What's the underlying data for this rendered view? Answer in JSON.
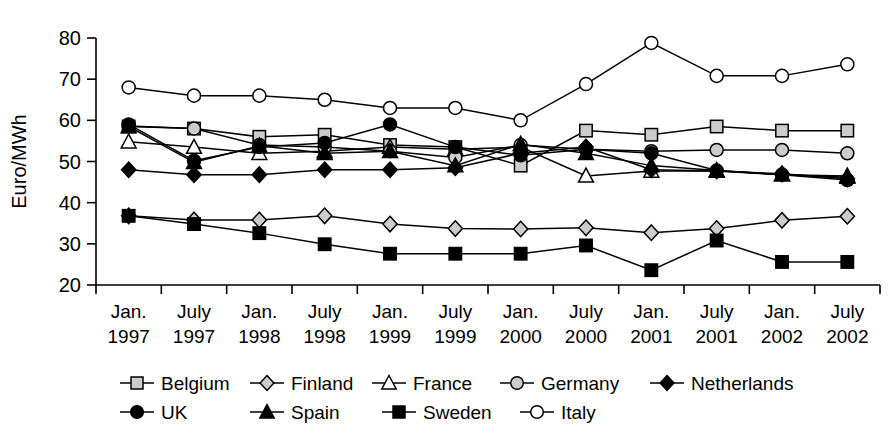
{
  "chart_data": {
    "type": "line",
    "title": "",
    "xlabel": "",
    "ylabel": "Euro/MWh",
    "ylim": [
      20,
      80
    ],
    "ytick_labels": [
      "80",
      "70",
      "60",
      "50",
      "40",
      "30",
      "20"
    ],
    "yticks": [
      80,
      70,
      60,
      50,
      40,
      30,
      20
    ],
    "grid": false,
    "legend_position": "bottom",
    "categories": [
      "Jan. 1997",
      "July 1997",
      "Jan. 1998",
      "July 1998",
      "Jan. 1999",
      "July 1999",
      "Jan. 2000",
      "July 2000",
      "Jan. 2001",
      "July 2001",
      "Jan. 2002",
      "July 2002"
    ],
    "category_lines": [
      [
        "Jan.",
        "1997"
      ],
      [
        "July",
        "1997"
      ],
      [
        "Jan.",
        "1998"
      ],
      [
        "July",
        "1998"
      ],
      [
        "Jan.",
        "1999"
      ],
      [
        "July",
        "1999"
      ],
      [
        "Jan.",
        "2000"
      ],
      [
        "July",
        "2000"
      ],
      [
        "Jan.",
        "2001"
      ],
      [
        "July",
        "2001"
      ],
      [
        "Jan.",
        "2002"
      ],
      [
        "July",
        "2002"
      ]
    ],
    "series": [
      {
        "name": "Belgium",
        "marker": "open-square",
        "values": [
          58.5,
          58.0,
          56.0,
          56.5,
          54.0,
          53.5,
          49.0,
          57.5,
          56.5,
          58.5,
          57.5,
          57.5
        ]
      },
      {
        "name": "Finland",
        "marker": "open-diamond",
        "values": [
          36.8,
          35.8,
          35.8,
          36.8,
          34.8,
          33.7,
          33.6,
          33.9,
          32.7,
          33.7,
          35.7,
          36.7
        ]
      },
      {
        "name": "France",
        "marker": "open-triangle",
        "values": [
          54.8,
          53.5,
          52.0,
          52.5,
          53.5,
          53.0,
          53.5,
          46.5,
          47.7,
          47.7,
          46.8,
          46.5
        ]
      },
      {
        "name": "Germany",
        "marker": "gray-circle",
        "values": [
          58.6,
          58.0,
          54.0,
          53.5,
          52.5,
          51.0,
          54.0,
          53.0,
          52.5,
          52.8,
          52.8,
          52.0
        ]
      },
      {
        "name": "Netherlands",
        "marker": "solid-diamond",
        "values": [
          48.0,
          46.8,
          46.8,
          48.0,
          48.0,
          48.5,
          52.0,
          53.5,
          48.0,
          47.7,
          47.0,
          45.8
        ]
      },
      {
        "name": "UK",
        "marker": "solid-circle",
        "values": [
          59.0,
          50.2,
          53.5,
          54.5,
          59.0,
          53.5,
          51.5,
          53.0,
          52.0,
          47.8,
          46.8,
          45.5
        ]
      },
      {
        "name": "Spain",
        "marker": "solid-triangle",
        "values": [
          58.5,
          49.8,
          53.8,
          52.0,
          52.5,
          49.0,
          54.2,
          52.0,
          49.0,
          47.8,
          46.8,
          46.2
        ]
      },
      {
        "name": "Sweden",
        "marker": "solid-square",
        "values": [
          36.8,
          34.8,
          32.6,
          29.9,
          27.6,
          27.6,
          27.6,
          29.6,
          23.6,
          30.8,
          25.6,
          25.6
        ]
      },
      {
        "name": "Italy",
        "marker": "open-circle",
        "values": [
          68.0,
          66.0,
          66.0,
          65.0,
          63.0,
          63.0,
          60.0,
          68.8,
          78.8,
          70.8,
          70.8,
          73.6
        ]
      }
    ]
  },
  "legend": {
    "rows": [
      [
        "Belgium",
        "Finland",
        "France",
        "Germany",
        "Netherlands"
      ],
      [
        "UK",
        "Spain",
        "Sweden",
        "Italy"
      ]
    ]
  },
  "colors": {
    "ink": "#000000",
    "gray_fill": "#cccccc",
    "white_fill": "#ffffff"
  }
}
